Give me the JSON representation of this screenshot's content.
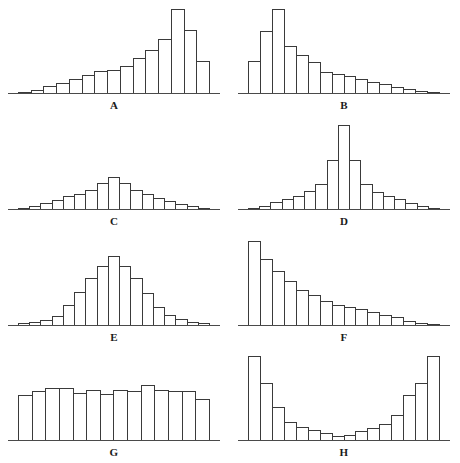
{
  "figure": {
    "title": "",
    "panel_count": 8,
    "colors": {
      "bar_outline": "#3a3a3a",
      "axis": "#4a4a4a",
      "background": "#ffffff",
      "label": "#1a1a1a"
    }
  },
  "chart_data": [
    {
      "type": "bar",
      "title": "A",
      "label": "A",
      "shape": "left-skewed",
      "xlabel": "",
      "ylabel": "",
      "grid": false,
      "legend": "none",
      "ylim": [
        0,
        100
      ],
      "categories": [
        "1",
        "2",
        "3",
        "4",
        "5",
        "6",
        "7",
        "8",
        "9",
        "10",
        "11",
        "12",
        "13",
        "14",
        "15"
      ],
      "values": [
        2,
        5,
        9,
        12,
        17,
        22,
        26,
        27,
        32,
        41,
        50,
        62,
        97,
        73,
        37
      ]
    },
    {
      "type": "bar",
      "title": "B",
      "label": "B",
      "shape": "right-skewed",
      "xlabel": "",
      "ylabel": "",
      "grid": false,
      "legend": "none",
      "ylim": [
        0,
        100
      ],
      "categories": [
        "1",
        "2",
        "3",
        "4",
        "5",
        "6",
        "7",
        "8",
        "9",
        "10",
        "11",
        "12",
        "13",
        "14",
        "15",
        "16"
      ],
      "values": [
        37,
        72,
        97,
        55,
        44,
        36,
        25,
        23,
        20,
        17,
        14,
        11,
        8,
        6,
        3,
        2
      ]
    },
    {
      "type": "bar",
      "title": "C",
      "label": "C",
      "shape": "platykurtic-flat-tailed",
      "xlabel": "",
      "ylabel": "",
      "grid": false,
      "legend": "none",
      "ylim": [
        0,
        100
      ],
      "categories": [
        "1",
        "2",
        "3",
        "4",
        "5",
        "6",
        "7",
        "8",
        "9",
        "10",
        "11",
        "12",
        "13",
        "14",
        "15",
        "16",
        "17"
      ],
      "values": [
        2,
        5,
        8,
        11,
        16,
        18,
        23,
        31,
        37,
        31,
        23,
        18,
        14,
        10,
        7,
        4,
        2
      ]
    },
    {
      "type": "bar",
      "title": "D",
      "label": "D",
      "shape": "leptokurtic-peaked",
      "xlabel": "",
      "ylabel": "",
      "grid": false,
      "legend": "none",
      "ylim": [
        0,
        100
      ],
      "categories": [
        "1",
        "2",
        "3",
        "4",
        "5",
        "6",
        "7",
        "8",
        "9",
        "10",
        "11",
        "12",
        "13",
        "14",
        "15",
        "16",
        "17"
      ],
      "values": [
        2,
        5,
        9,
        13,
        16,
        22,
        30,
        57,
        97,
        57,
        30,
        21,
        16,
        12,
        8,
        5,
        2
      ]
    },
    {
      "type": "bar",
      "title": "E",
      "label": "E",
      "shape": "normal-bell",
      "xlabel": "",
      "ylabel": "",
      "grid": false,
      "legend": "none",
      "ylim": [
        0,
        100
      ],
      "categories": [
        "1",
        "2",
        "3",
        "4",
        "5",
        "6",
        "7",
        "8",
        "9",
        "10",
        "11",
        "12",
        "13",
        "14",
        "15",
        "16",
        "17"
      ],
      "values": [
        3,
        5,
        7,
        11,
        24,
        39,
        54,
        68,
        80,
        68,
        54,
        37,
        22,
        12,
        8,
        5,
        3
      ]
    },
    {
      "type": "bar",
      "title": "F",
      "label": "F",
      "shape": "exponential-decay",
      "xlabel": "",
      "ylabel": "",
      "grid": false,
      "legend": "none",
      "ylim": [
        0,
        100
      ],
      "categories": [
        "1",
        "2",
        "3",
        "4",
        "5",
        "6",
        "7",
        "8",
        "9",
        "10",
        "11",
        "12",
        "13",
        "14",
        "15",
        "16"
      ],
      "values": [
        97,
        76,
        62,
        51,
        41,
        35,
        28,
        24,
        22,
        19,
        16,
        13,
        10,
        6,
        3,
        2
      ]
    },
    {
      "type": "bar",
      "title": "G",
      "label": "G",
      "shape": "uniform-rectangular",
      "xlabel": "",
      "ylabel": "",
      "grid": false,
      "legend": "none",
      "ylim": [
        0,
        100
      ],
      "categories": [
        "1",
        "2",
        "3",
        "4",
        "5",
        "6",
        "7",
        "8",
        "9",
        "10",
        "11",
        "12",
        "13",
        "14"
      ],
      "values": [
        52,
        57,
        60,
        60,
        55,
        58,
        53,
        58,
        57,
        64,
        58,
        57,
        57,
        48
      ]
    },
    {
      "type": "bar",
      "title": "H",
      "label": "H",
      "shape": "bimodal-u-shaped",
      "xlabel": "",
      "ylabel": "",
      "grid": false,
      "legend": "none",
      "ylim": [
        0,
        100
      ],
      "categories": [
        "1",
        "2",
        "3",
        "4",
        "5",
        "6",
        "7",
        "8",
        "9",
        "10",
        "11",
        "12",
        "13",
        "14",
        "15",
        "16"
      ],
      "values": [
        97,
        66,
        39,
        22,
        16,
        13,
        9,
        6,
        7,
        11,
        15,
        19,
        29,
        52,
        66,
        97
      ]
    }
  ]
}
